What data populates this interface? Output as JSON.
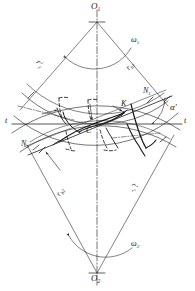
{
  "figure": {
    "type": "engineering-line-diagram",
    "width": 195,
    "height": 291,
    "stroke_color": "#1a1a1a",
    "background_color": "#ffffff"
  },
  "labels": {
    "center_upper": "O",
    "center_upper_sub": "1",
    "center_lower": "O",
    "center_lower_sub": "2",
    "omega_upper": "ω",
    "omega_upper_sub": "1",
    "omega_lower": "ω",
    "omega_lower_sub": "2",
    "radius_pitch_upper": "r′",
    "radius_pitch_upper_sub": "1",
    "radius_base_upper": "r",
    "radius_base_upper_sub": "b1",
    "radius_base_lower": "r",
    "radius_base_lower_sub": "b2",
    "radius_pitch_lower": "r′",
    "radius_pitch_lower_sub": "2",
    "tangent_left": "t",
    "tangent_right": "t",
    "point_n1": "N",
    "point_n1_sub": "1",
    "point_n2": "N",
    "point_n2_sub": "2",
    "point_k": "K",
    "point_c": "C",
    "pressure_angle": "α′"
  },
  "geometry": {
    "pinion_center": {
      "x": 97,
      "y": 22
    },
    "gear_center": {
      "x": 97,
      "y": 273
    },
    "pitch_point": {
      "x": 92,
      "y": 124
    },
    "contact_point_k": {
      "x": 124,
      "y": 113
    },
    "n1_point": {
      "x": 150,
      "y": 100
    },
    "n2_point": {
      "x": 42,
      "y": 150
    },
    "tangent_line_y": 124,
    "tangent_line_x_start": 12,
    "tangent_line_x_end": 182,
    "pressure_angle_deg": 20
  }
}
